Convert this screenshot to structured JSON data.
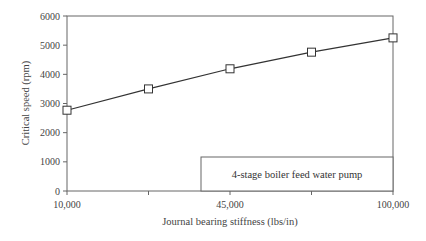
{
  "chart_data": {
    "type": "line",
    "title": "",
    "xlabel": "Journal bearing stiffness (lbs/in)",
    "ylabel": "Critical speed (rpm)",
    "x_tick_labels": [
      "10,000",
      "",
      "45,000",
      "",
      "100,000"
    ],
    "x_tick_positions": [
      0,
      1,
      2,
      3,
      4
    ],
    "y_ticks": [
      0,
      1000,
      2000,
      3000,
      4000,
      5000,
      6000
    ],
    "y_tick_labels": [
      "0",
      "1000",
      "2000",
      "3000",
      "4000",
      "5000",
      "6000"
    ],
    "ylim": [
      0,
      6000
    ],
    "grid": false,
    "legend_position": "lower right (inside)",
    "series": [
      {
        "name": "4-stage boiler feed water pump",
        "marker": "open-square",
        "x": [
          0,
          1,
          2,
          3,
          4
        ],
        "values": [
          2770,
          3500,
          4190,
          4760,
          5250
        ]
      }
    ]
  },
  "legend": {
    "label": "4-stage boiler feed water pump"
  },
  "colors": {
    "line": "#333333",
    "axis": "#555555",
    "marker_fill": "#ffffff"
  }
}
